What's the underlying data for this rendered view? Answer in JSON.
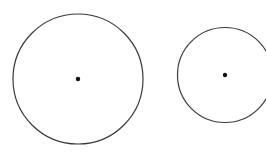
{
  "diagram": {
    "background": "#ffffff",
    "stroke_color": "#3a3a3a",
    "circles": [
      {
        "name": "large-circle",
        "cx": 78,
        "cy": 79,
        "r": 65,
        "center_dot_r": 2.2
      },
      {
        "name": "small-circle",
        "cx": 225,
        "cy": 75,
        "r": 47.5,
        "center_dot_r": 2.2
      }
    ]
  }
}
